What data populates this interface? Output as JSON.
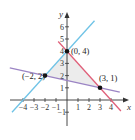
{
  "chart_data": {
    "type": "line",
    "title": "",
    "xlabel": "x",
    "ylabel": "y",
    "xlim": [
      -5,
      4.8
    ],
    "ylim": [
      -2,
      7
    ],
    "grid": false,
    "x_ticks": [
      -4,
      -3,
      -2,
      -1,
      1,
      2,
      3,
      4
    ],
    "x_tick_labels": [
      "−4",
      "−3",
      "−2",
      "−1",
      "1",
      "2",
      "3",
      "4"
    ],
    "y_ticks": [
      -1,
      1,
      2,
      3,
      4,
      5,
      6
    ],
    "y_tick_labels": [
      "−1",
      "1",
      "2",
      "3",
      "4",
      "5",
      "6"
    ],
    "series": [
      {
        "name": "y = x + 4",
        "color": "#6fc3e6",
        "x": [
          -5,
          2.5
        ],
        "y": [
          -1,
          6.5
        ]
      },
      {
        "name": "y = -x + 4",
        "color": "#e0607a",
        "x": [
          -0.8,
          4.9
        ],
        "y": [
          4.8,
          -0.9
        ]
      },
      {
        "name": "y = -x/5 + 8/5",
        "color": "#9b84c4",
        "x": [
          -5.2,
          4.8
        ],
        "y": [
          2.64,
          0.64
        ]
      }
    ],
    "points": [
      {
        "x": -2,
        "y": 2,
        "label": "(−2, 2)"
      },
      {
        "x": 0,
        "y": 4,
        "label": "(0, 4)"
      },
      {
        "x": 3,
        "y": 1,
        "label": "(3, 1)"
      }
    ],
    "shaded_region": {
      "vertices": [
        [
          -2,
          2
        ],
        [
          0,
          4
        ],
        [
          3,
          1
        ]
      ],
      "color": "#ececec"
    }
  }
}
